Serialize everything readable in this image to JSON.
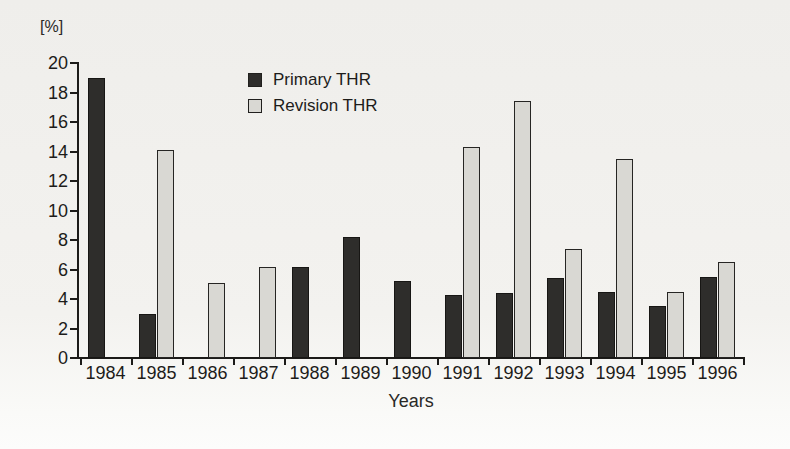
{
  "chart_data": {
    "type": "bar",
    "title": "",
    "xlabel": "Years",
    "ylabel": "[%]",
    "ylim": [
      0,
      20
    ],
    "y_ticks": [
      0,
      2,
      4,
      6,
      8,
      10,
      12,
      14,
      16,
      18,
      20
    ],
    "grid": false,
    "legend_position": "top-center",
    "categories": [
      "1984",
      "1985",
      "1986",
      "1987",
      "1988",
      "1989",
      "1990",
      "1991",
      "1992",
      "1993",
      "1994",
      "1995",
      "1996"
    ],
    "series": [
      {
        "name": "Primary THR",
        "color": "#2e2d2b",
        "values": [
          19.0,
          3.0,
          null,
          null,
          6.2,
          8.2,
          5.2,
          4.3,
          4.4,
          5.4,
          4.5,
          3.5,
          5.5
        ]
      },
      {
        "name": "Revision THR",
        "color": "#d9d8d3",
        "values": [
          null,
          14.1,
          5.1,
          6.2,
          null,
          null,
          null,
          14.3,
          17.4,
          7.4,
          13.5,
          4.5,
          6.5
        ]
      }
    ]
  },
  "layout": {
    "plot_left": 80,
    "baseline_y": 358,
    "plot_top": 63,
    "slot_width": 51,
    "bar_width": 17
  }
}
